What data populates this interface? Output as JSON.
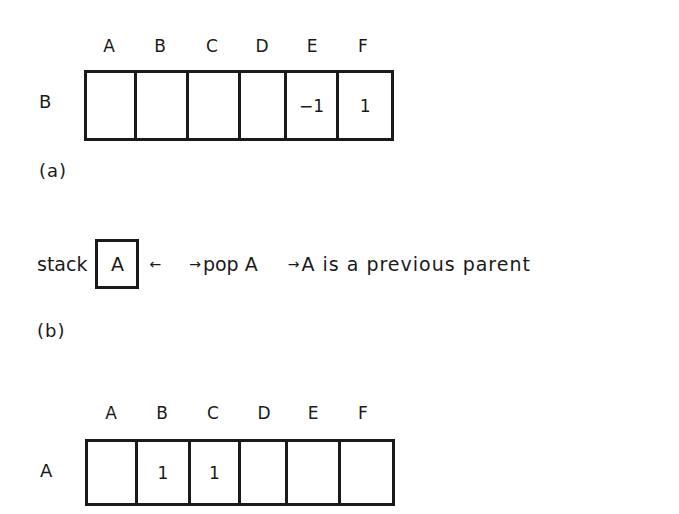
{
  "figure_a": {
    "row_label": "B",
    "column_headers": [
      "A",
      "B",
      "C",
      "D",
      "E",
      "F"
    ],
    "cells": [
      "",
      "",
      "",
      "",
      "−1",
      "1"
    ],
    "caption": "(a)"
  },
  "figure_b": {
    "prefix": "stack",
    "stack_contents": "A",
    "push_arrow": "←",
    "step1_arrow": "→",
    "step1_text": "pop A",
    "step2_arrow": "→",
    "step2_text": "A is a previous parent",
    "caption": "(b)"
  },
  "figure_c": {
    "row_label": "A",
    "column_headers": [
      "A",
      "B",
      "C",
      "D",
      "E",
      "F"
    ],
    "cells": [
      "",
      "1",
      "1",
      "",
      "",
      ""
    ]
  }
}
